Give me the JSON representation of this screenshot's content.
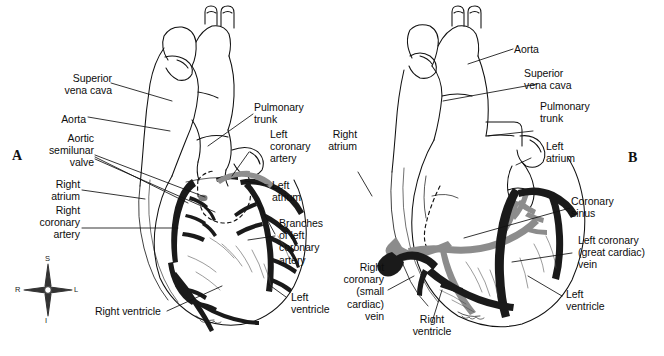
{
  "figure": {
    "background_color": "#ffffff",
    "ink_color": "#111111",
    "vessel_dark_color": "#1a1a1a",
    "vessel_gray_color": "#8c8c8c"
  },
  "panels": [
    {
      "letter": "A",
      "view": "anterior",
      "labels": [
        {
          "id": "superior-vena-cava",
          "text": "Superior\nvena cava"
        },
        {
          "id": "aorta",
          "text": "Aorta"
        },
        {
          "id": "aortic-semilunar-valve",
          "text": "Aortic\nsemilunar\nvalve"
        },
        {
          "id": "right-atrium",
          "text": "Right\natrium"
        },
        {
          "id": "right-coronary-artery",
          "text": "Right\ncoronary\nartery"
        },
        {
          "id": "right-ventricle",
          "text": "Right ventricle"
        },
        {
          "id": "pulmonary-trunk",
          "text": "Pulmonary\ntrunk"
        },
        {
          "id": "left-coronary-artery",
          "text": "Left\ncoronary\nartery"
        },
        {
          "id": "left-atrium",
          "text": "Left\natrium"
        },
        {
          "id": "branches-of-left-coronary-artery",
          "text": "Branches\nof left\ncoronary\nartery"
        },
        {
          "id": "left-ventricle",
          "text": "Left\nventricle"
        }
      ],
      "compass": {
        "superior": "S",
        "inferior": "I",
        "right": "R",
        "left": "L"
      }
    },
    {
      "letter": "B",
      "view": "posterior",
      "labels": [
        {
          "id": "right-atrium",
          "text": "Right\natrium"
        },
        {
          "id": "right-coronary-small-cardiac-vein",
          "text": "Right\ncoronary\n(small\ncardiac)\nvein"
        },
        {
          "id": "right-ventricle",
          "text": "Right\nventricle"
        },
        {
          "id": "aorta",
          "text": "Aorta"
        },
        {
          "id": "superior-vena-cava",
          "text": "Superior\nvena cava"
        },
        {
          "id": "pulmonary-trunk",
          "text": "Pulmonary\ntrunk"
        },
        {
          "id": "left-atrium",
          "text": "Left\natrium"
        },
        {
          "id": "coronary-sinus",
          "text": "Coronary\nsinus"
        },
        {
          "id": "left-coronary-great-cardiac-vein",
          "text": "Left coronary\n(great cardiac)\nvein"
        },
        {
          "id": "left-ventricle",
          "text": "Left\nventricle"
        }
      ]
    }
  ]
}
